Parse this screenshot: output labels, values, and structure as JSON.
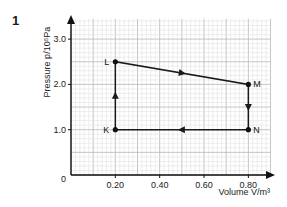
{
  "question_number": "1",
  "chart_data": {
    "type": "line",
    "title": "",
    "xlabel": "Volume V/m³",
    "ylabel": "Pressure p/10⁵Pa",
    "xlim": [
      0,
      0.9
    ],
    "ylim": [
      0,
      3.5
    ],
    "x_ticks": [
      "0.20",
      "0.40",
      "0.60",
      "0.80"
    ],
    "x_tick_values": [
      0.2,
      0.4,
      0.6,
      0.8
    ],
    "y_ticks": [
      "1.0",
      "2.0",
      "3.0"
    ],
    "y_tick_values": [
      1.0,
      2.0,
      3.0
    ],
    "origin_label": "0",
    "grid": true,
    "cycle": "K → L → M → N → K",
    "points": [
      {
        "label": "K",
        "x": 0.2,
        "y": 1.0
      },
      {
        "label": "L",
        "x": 0.2,
        "y": 2.5
      },
      {
        "label": "M",
        "x": 0.8,
        "y": 2.0
      },
      {
        "label": "N",
        "x": 0.8,
        "y": 1.0
      }
    ],
    "series": [
      {
        "name": "cycle",
        "x": [
          0.2,
          0.2,
          0.8,
          0.8,
          0.2
        ],
        "y": [
          1.0,
          2.5,
          2.0,
          1.0,
          1.0
        ]
      }
    ],
    "segments": [
      {
        "from": "K",
        "to": "L",
        "direction": "up"
      },
      {
        "from": "L",
        "to": "M",
        "direction": "right"
      },
      {
        "from": "M",
        "to": "N",
        "direction": "down"
      },
      {
        "from": "N",
        "to": "K",
        "direction": "left"
      }
    ]
  }
}
